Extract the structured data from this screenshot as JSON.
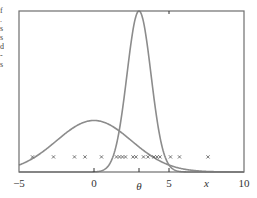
{
  "chart_data": {
    "type": "line",
    "title": "",
    "xlabel": "",
    "ylabel": "",
    "xlim": [
      -5,
      10
    ],
    "ylim": [
      0,
      1
    ],
    "grid": false,
    "legend": null,
    "x_ticks": [
      {
        "value": -5,
        "label": "−5",
        "italic": false
      },
      {
        "value": 0,
        "label": "0",
        "italic": false
      },
      {
        "value": 3,
        "label": "θ",
        "italic": true
      },
      {
        "value": 5,
        "label": "5",
        "italic": false
      },
      {
        "value": 7.5,
        "label": "x",
        "italic": true
      },
      {
        "value": 10,
        "label": "10",
        "italic": false
      }
    ],
    "top_ticks": [
      5
    ],
    "series": [
      {
        "name": "prior (broad Gaussian)",
        "kind": "gaussian",
        "mean": 0,
        "sd": 2.5,
        "peak_rel": 0.32,
        "color": "#8c8c8c"
      },
      {
        "name": "posterior (narrow Gaussian)",
        "kind": "gaussian",
        "mean": 3,
        "sd": 0.8,
        "peak_rel": 1.0,
        "color": "#8c8c8c"
      }
    ],
    "samples": {
      "marker": "x",
      "y_rel": 0.1,
      "x": [
        -4.1,
        -2.7,
        -1.3,
        -0.6,
        0.5,
        1.5,
        1.7,
        1.9,
        2.1,
        2.6,
        2.8,
        3.3,
        3.6,
        4.0,
        4.2,
        4.4,
        5.1,
        5.7,
        7.6
      ]
    }
  },
  "edge_fragments": "f\n.\ns\ns\nd\n-\ns"
}
